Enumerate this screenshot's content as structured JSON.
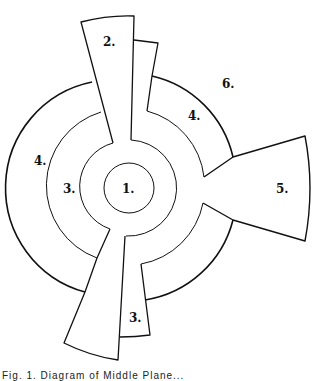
{
  "diagram": {
    "labels": {
      "zone1": "1.",
      "zone2": "2.",
      "zone3_left": "3.",
      "zone3_bottom": "3.",
      "zone4_left": "4.",
      "zone4_right": "4.",
      "zone5": "5.",
      "zone6": "6."
    },
    "stroke_color": "#111111",
    "background": "#ffffff"
  },
  "caption": "Fig. 1. Diagram of Middle Plane..."
}
